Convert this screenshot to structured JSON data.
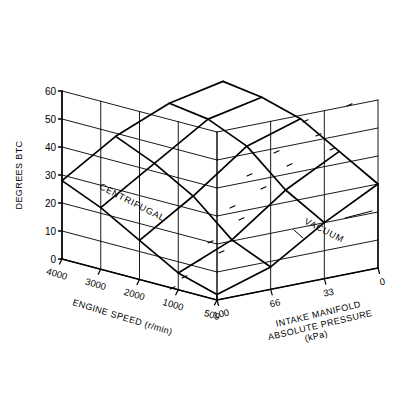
{
  "figure": {
    "kind": "3d-surface-wireframe",
    "background": "#ffffff",
    "line_color": "#000000"
  },
  "axes": {
    "z": {
      "title": "DEGREES  BTC",
      "ticks": [
        "60",
        "50",
        "40",
        "30",
        "20",
        "10",
        "0"
      ],
      "values": [
        60,
        50,
        40,
        30,
        20,
        10,
        0
      ],
      "min": 0,
      "max": 60
    },
    "x": {
      "title_line1": "ENGINE SPEED (r/min)",
      "ticks": [
        "4000",
        "3000",
        "2000",
        "1000",
        "500"
      ],
      "values": [
        4000,
        3000,
        2000,
        1000,
        500
      ]
    },
    "y": {
      "title_line1": "INTAKE MANIFOLD",
      "title_line2": "ABSOLUTE PRESSURE",
      "title_line3": "(kPa)",
      "ticks": [
        "100",
        "66",
        "33",
        "0"
      ],
      "values": [
        100,
        66,
        33,
        0
      ]
    }
  },
  "annotations": [
    {
      "name": "centrifugal-label",
      "text": "CENTRIFUGAL"
    },
    {
      "name": "vacuum-label",
      "text": "VACUUM"
    }
  ],
  "chart_data": {
    "type": "surface",
    "title": "",
    "xlabel": "ENGINE SPEED (r/min)",
    "ylabel": "INTAKE MANIFOLD ABSOLUTE PRESSURE (kPa)",
    "zlabel": "DEGREES  BTC",
    "zlim": [
      0,
      60
    ],
    "grid": true,
    "legend": "none",
    "x": [
      4000,
      3000,
      2000,
      1000,
      500
    ],
    "y": [
      100,
      66,
      33,
      0
    ],
    "z": [
      [
        28,
        40,
        48,
        52
      ],
      [
        22,
        34,
        46,
        50
      ],
      [
        14,
        26,
        40,
        46
      ],
      [
        6,
        14,
        28,
        38
      ],
      [
        2,
        8,
        20,
        30
      ]
    ],
    "z_note": "rows follow x (engine speed 4000->500), columns follow y (MAP 100->0 kPa)"
  }
}
